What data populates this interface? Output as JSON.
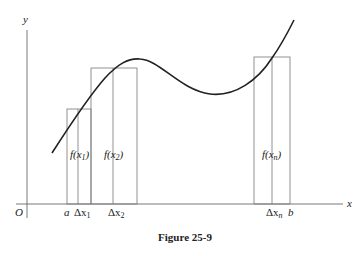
{
  "figure": {
    "caption": "Figure 25-9",
    "axes": {
      "x_label": "x",
      "y_label": "y",
      "origin_label": "O"
    },
    "tick_labels": {
      "a": "a",
      "dx1": "Δx",
      "dx1_sub": "1",
      "dx2": "Δx",
      "dx2_sub": "2",
      "dxn": "Δx",
      "dxn_sub": "n",
      "b": "b"
    },
    "rect_labels": {
      "f1_pre": "f(x",
      "f1_sub": "1",
      "f1_post": ")",
      "f2_pre": "f(x",
      "f2_sub": "2",
      "f2_post": ")",
      "fn_pre": "f(x",
      "fn_sub": "n",
      "fn_post": ")"
    },
    "rectangles": [
      {
        "name": "rect-1",
        "x_left": 67,
        "x_mid": 78,
        "x_right": 91,
        "top": 109
      },
      {
        "name": "rect-2",
        "x_left": 91,
        "x_mid": 113,
        "x_right": 137,
        "top": 68
      },
      {
        "name": "rect-n",
        "x_left": 254,
        "x_mid": 272,
        "x_right": 290,
        "top": 57
      }
    ],
    "colors": {
      "curve": "#222222",
      "lines": "#777777",
      "background": "#ffffff"
    }
  }
}
